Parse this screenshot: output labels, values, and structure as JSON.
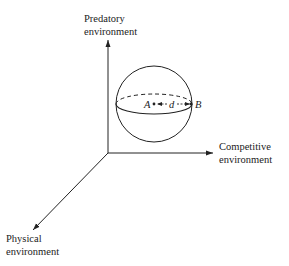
{
  "diagram": {
    "axes": {
      "vertical": {
        "label_line1": "Predatory",
        "label_line2": "environment"
      },
      "horizontal": {
        "label_line1": "Competitive",
        "label_line2": "environment"
      },
      "diagonal": {
        "label_line1": "Physical",
        "label_line2": "environment"
      }
    },
    "sphere": {
      "center_point_label": "A",
      "edge_point_label": "B",
      "distance_label": "d"
    },
    "colors": {
      "ink": "#222222",
      "background": "#ffffff"
    }
  }
}
